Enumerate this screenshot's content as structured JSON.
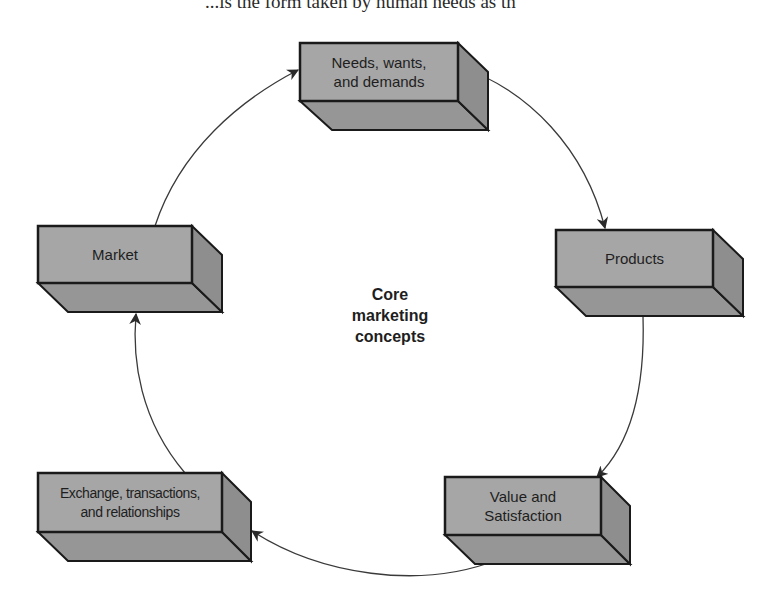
{
  "page": {
    "top_text": "...is the form taken by human needs as th"
  },
  "diagram": {
    "title": "Core marketing concepts",
    "center_label": [
      "Core",
      "marketing",
      "concepts"
    ],
    "colors": {
      "front": "#a6a6a6",
      "side": "#8e8e8e",
      "bottom": "#969696",
      "stroke": "#1a1a1a",
      "arrow": "#3a3a3a"
    },
    "nodes": [
      {
        "id": "needs",
        "lines": [
          "Needs, wants,",
          "and demands"
        ]
      },
      {
        "id": "products",
        "lines": [
          "Products"
        ]
      },
      {
        "id": "value",
        "lines": [
          "Value and",
          "Satisfaction"
        ]
      },
      {
        "id": "exchange",
        "lines": [
          "Exchange, transactions,",
          "and relationships"
        ]
      },
      {
        "id": "market",
        "lines": [
          "Market"
        ]
      }
    ],
    "edges": [
      {
        "from": "needs",
        "to": "products"
      },
      {
        "from": "products",
        "to": "value"
      },
      {
        "from": "value",
        "to": "exchange"
      },
      {
        "from": "exchange",
        "to": "market"
      },
      {
        "from": "market",
        "to": "needs"
      }
    ]
  }
}
